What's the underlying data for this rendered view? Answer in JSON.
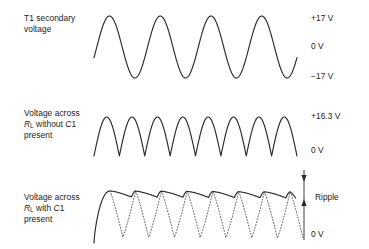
{
  "figure": {
    "stroke_color": "#2b2b2b",
    "background": "#ffffff"
  },
  "panels": [
    {
      "id": "t1-secondary",
      "label_lines": [
        "T1 secondary",
        "voltage"
      ],
      "label_html": "T1 secondary<br>voltage",
      "axis_labels": [
        {
          "name": "peak-positive",
          "text": "+17 V",
          "y": 18
        },
        {
          "name": "zero",
          "text": "0 V",
          "y": 46
        },
        {
          "name": "peak-negative",
          "text": "−17 V",
          "y": 76
        }
      ],
      "wave": {
        "type": "sine",
        "cycles": 4,
        "x_start": 94,
        "x_end": 297,
        "baseline_y": 47,
        "amplitude": 31,
        "phase_start_deg": -20
      }
    },
    {
      "id": "rl-without-c1",
      "label_lines": [
        "Voltage across",
        "R_L without C1",
        "present"
      ],
      "label_html": "Voltage across<br><span class=\"ital\">R</span><sub>L</sub> without <span class=\"ital\">C</span>1<br>present",
      "axis_labels": [
        {
          "name": "peak-positive",
          "text": "+16.3 V",
          "y": 116
        },
        {
          "name": "zero",
          "text": "0 V",
          "y": 150
        }
      ],
      "wave": {
        "type": "full-wave-rectified",
        "humps": 8,
        "x_start": 94,
        "x_end": 297,
        "baseline_y": 156,
        "amplitude": 39
      }
    },
    {
      "id": "rl-with-c1",
      "label_lines": [
        "Voltage across",
        "R_L with C1",
        "present"
      ],
      "label_html": "Voltage across<br><span class=\"ital\">R</span><sub>L</sub> with <span class=\"ital\">C</span>1<br>present",
      "axis_labels": [
        {
          "name": "zero",
          "text": "0 V",
          "y": 234
        }
      ],
      "annotation": {
        "name": "ripple",
        "text": "Ripple",
        "text_x": 315,
        "text_y": 198,
        "arrow_x": 304,
        "arrow_top_y": 170,
        "arrow_bottom_y": 206,
        "stem_bottom_y": 240
      },
      "wave": {
        "type": "filtered-ripple",
        "humps": 8,
        "x_start": 94,
        "x_end": 300,
        "baseline_y": 243,
        "peak_y": 191,
        "ripple_depth": 6,
        "dotted_depth": 46
      }
    }
  ]
}
